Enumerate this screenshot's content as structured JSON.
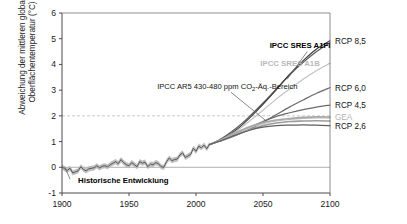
{
  "chart_data": {
    "type": "line",
    "title": "",
    "xlabel": "",
    "ylabel_line1": "Abweichung der mittleren globalen",
    "ylabel_line2": "Oberflächentemperatur (°C)",
    "xlim": [
      1900,
      2100
    ],
    "ylim": [
      -1,
      6
    ],
    "xticks": [
      "1900",
      "1950",
      "2000",
      "2050",
      "2100"
    ],
    "xtick_values": [
      1900,
      1950,
      2000,
      2050,
      2100
    ],
    "yticks": [
      "-1",
      "0",
      "1",
      "2",
      "3",
      "4",
      "5",
      "6"
    ],
    "ytick_values": [
      -1,
      0,
      1,
      2,
      3,
      4,
      5,
      6
    ],
    "grid": false,
    "legend_position": "right-outside",
    "reference_lines": [
      {
        "name": "two-degree-line",
        "y": 2,
        "style": "dashed",
        "color": "#c9c9c9"
      },
      {
        "name": "zero-line",
        "y": 0,
        "style": "solid",
        "color": "#b0b0b0"
      }
    ],
    "annotations": [
      {
        "name": "historical-label",
        "text": "Historische Entwicklung",
        "x": 1912,
        "y": -0.62,
        "bold": true,
        "color": "#000000"
      },
      {
        "name": "ar5-range-label",
        "text": "IPCC AR5 430-480 ppm CO",
        "subscript": "2",
        "text_after": "-Äq.-Bereich",
        "x": 1971,
        "y": 3.05,
        "color": "#111111"
      },
      {
        "name": "sres-a1fi-label",
        "text": "IPCC SRES A1FI",
        "x": 2055,
        "y": 4.62,
        "bold": true,
        "color": "#000000"
      },
      {
        "name": "sres-a1b-label",
        "text": "IPCC SRES A1B",
        "x": 2048,
        "y": 3.95,
        "bold": true,
        "color": "#b9b9b9"
      }
    ],
    "series": [
      {
        "name": "Historische Entwicklung",
        "kind": "historical",
        "color": "#555555",
        "band_color": "#b5b5b5",
        "x": [
          1900,
          1902,
          1904,
          1906,
          1908,
          1910,
          1912,
          1914,
          1916,
          1918,
          1920,
          1922,
          1924,
          1926,
          1928,
          1930,
          1932,
          1934,
          1936,
          1938,
          1940,
          1942,
          1944,
          1946,
          1948,
          1950,
          1952,
          1954,
          1956,
          1958,
          1960,
          1962,
          1964,
          1966,
          1968,
          1970,
          1972,
          1974,
          1976,
          1978,
          1980,
          1982,
          1984,
          1986,
          1988,
          1990,
          1992,
          1994,
          1996,
          1998,
          2000,
          2002,
          2004,
          2006,
          2008,
          2010
        ],
        "values": [
          0.02,
          -0.06,
          -0.12,
          -0.04,
          -0.22,
          -0.18,
          -0.14,
          0.02,
          -0.08,
          -0.14,
          -0.06,
          -0.04,
          -0.02,
          0.06,
          -0.02,
          0.04,
          0.06,
          0.02,
          0.1,
          0.16,
          0.22,
          0.14,
          0.3,
          0.18,
          0.1,
          0.06,
          0.18,
          0.1,
          0.02,
          0.22,
          0.16,
          0.2,
          0.02,
          0.12,
          0.1,
          0.18,
          0.14,
          0.02,
          0.0,
          0.22,
          0.36,
          0.26,
          0.3,
          0.32,
          0.48,
          0.56,
          0.38,
          0.44,
          0.5,
          0.74,
          0.62,
          0.82,
          0.76,
          0.86,
          0.72,
          0.88
        ]
      },
      {
        "name": "RCP 8,5",
        "kind": "projection",
        "color": "#5a5a5a",
        "end_label": "RCP 8,5",
        "end_value": 4.85,
        "x": [
          2010,
          2020,
          2030,
          2040,
          2050,
          2060,
          2070,
          2080,
          2090,
          2100
        ],
        "values": [
          0.88,
          1.15,
          1.52,
          1.98,
          2.5,
          3.05,
          3.6,
          4.08,
          4.5,
          4.85
        ]
      },
      {
        "name": "IPCC SRES A1FI",
        "kind": "projection",
        "color": "#3f3f3f",
        "end_value": 4.92,
        "x": [
          2010,
          2020,
          2030,
          2040,
          2050,
          2060,
          2070,
          2080,
          2090,
          2100
        ],
        "values": [
          0.88,
          1.1,
          1.45,
          1.92,
          2.45,
          3.02,
          3.62,
          4.15,
          4.6,
          4.92
        ]
      },
      {
        "name": "IPCC SRES A1B",
        "kind": "projection",
        "color": "#c2c2c2",
        "end_value": 4.05,
        "x": [
          2010,
          2020,
          2030,
          2040,
          2050,
          2060,
          2070,
          2080,
          2090,
          2100
        ],
        "values": [
          0.88,
          1.1,
          1.4,
          1.8,
          2.22,
          2.66,
          3.05,
          3.42,
          3.76,
          4.05
        ]
      },
      {
        "name": "RCP 6,0",
        "kind": "projection",
        "color": "#6b6b6b",
        "end_label": "RCP 6,0",
        "end_value": 3.1,
        "x": [
          2010,
          2020,
          2030,
          2040,
          2050,
          2060,
          2070,
          2080,
          2090,
          2100
        ],
        "values": [
          0.88,
          1.05,
          1.25,
          1.48,
          1.75,
          2.05,
          2.35,
          2.62,
          2.88,
          3.1
        ]
      },
      {
        "name": "RCP 4,5",
        "kind": "projection",
        "color": "#6b6b6b",
        "end_label": "RCP 4,5",
        "end_value": 2.42,
        "x": [
          2010,
          2020,
          2030,
          2040,
          2050,
          2060,
          2070,
          2080,
          2090,
          2100
        ],
        "values": [
          0.88,
          1.08,
          1.32,
          1.56,
          1.78,
          1.98,
          2.12,
          2.24,
          2.34,
          2.42
        ]
      },
      {
        "name": "GEA",
        "kind": "projection",
        "color": "#bcbcbc",
        "end_label": "GEA",
        "end_value": 1.92,
        "x": [
          2010,
          2020,
          2030,
          2040,
          2050,
          2060,
          2070,
          2080,
          2090,
          2100
        ],
        "values": [
          0.88,
          1.08,
          1.32,
          1.54,
          1.7,
          1.8,
          1.86,
          1.9,
          1.92,
          1.92
        ]
      },
      {
        "name": "IPCC AR5 430-480 ppm CO2-Äq.-Bereich upper",
        "kind": "range",
        "color": "#a8a8a8",
        "end_value": 1.95,
        "x": [
          2010,
          2020,
          2030,
          2040,
          2050,
          2060,
          2070,
          2080,
          2090,
          2100
        ],
        "values": [
          0.88,
          1.1,
          1.36,
          1.58,
          1.74,
          1.84,
          1.9,
          1.94,
          1.96,
          1.95
        ]
      },
      {
        "name": "IPCC AR5 430-480 ppm CO2-Äq.-Bereich lower",
        "kind": "range",
        "color": "#9c9c9c",
        "end_value": 1.8,
        "x": [
          2010,
          2020,
          2030,
          2040,
          2050,
          2060,
          2070,
          2080,
          2090,
          2100
        ],
        "values": [
          0.88,
          1.06,
          1.26,
          1.46,
          1.62,
          1.72,
          1.78,
          1.8,
          1.81,
          1.8
        ]
      },
      {
        "name": "RCP 2,6",
        "kind": "projection",
        "color": "#5f5f5f",
        "end_label": "RCP 2,6",
        "end_value": 1.62,
        "x": [
          2010,
          2020,
          2030,
          2040,
          2050,
          2060,
          2070,
          2080,
          2090,
          2100
        ],
        "values": [
          0.88,
          1.06,
          1.26,
          1.44,
          1.56,
          1.62,
          1.64,
          1.65,
          1.64,
          1.62
        ]
      }
    ],
    "right_labels": [
      {
        "name": "rcp85",
        "text": "RCP 8,5",
        "y": 4.92,
        "color": "#111111"
      },
      {
        "name": "rcp60",
        "text": "RCP 6,0",
        "y": 3.1,
        "color": "#111111"
      },
      {
        "name": "rcp45",
        "text": "RCP 4,5",
        "y": 2.42,
        "color": "#111111"
      },
      {
        "name": "gea",
        "text": "GEA",
        "y": 1.95,
        "color": "#b4b4b4"
      },
      {
        "name": "rcp26",
        "text": "RCP 2,6",
        "y": 1.6,
        "color": "#111111"
      }
    ]
  }
}
